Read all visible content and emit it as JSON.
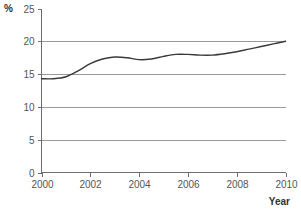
{
  "chart_data": {
    "type": "line",
    "title": "",
    "xlabel": "Year",
    "ylabel": "%",
    "xlim": [
      2000,
      2010
    ],
    "ylim": [
      0,
      25
    ],
    "grid": true,
    "legend_position": "none",
    "y_ticks": [
      0,
      5,
      10,
      15,
      20,
      25
    ],
    "y_tick_labels": [
      "0",
      "5",
      "10",
      "15",
      "20",
      "25"
    ],
    "x_ticks": [
      2000,
      2002,
      2004,
      2006,
      2008,
      2010
    ],
    "x_tick_labels": [
      "2000",
      "2002",
      "2004",
      "2006",
      "2008",
      "2010"
    ],
    "gridlines_y": [
      5,
      10,
      15,
      20
    ],
    "series": [
      {
        "name": "percentage",
        "color": "#3a3a3a",
        "x": [
          2000.0,
          2000.5,
          2001.0,
          2001.5,
          2002.0,
          2002.5,
          2003.0,
          2003.5,
          2004.0,
          2004.5,
          2005.0,
          2005.5,
          2006.0,
          2006.5,
          2007.0,
          2007.5,
          2008.0,
          2008.5,
          2009.0,
          2009.5,
          2010.0
        ],
        "values": [
          14.3,
          14.3,
          14.6,
          15.5,
          16.6,
          17.3,
          17.6,
          17.5,
          17.2,
          17.3,
          17.7,
          18.0,
          18.0,
          17.9,
          17.9,
          18.1,
          18.4,
          18.8,
          19.2,
          19.6,
          20.0
        ]
      }
    ]
  },
  "axes": {
    "y_axis_title": "%",
    "x_axis_title": "Year"
  },
  "colors": {
    "curve": "#3a3a3a",
    "grid": "#9a9a9a",
    "axis": "#6d6d6d",
    "tick_text": "#555555",
    "title_text": "#333333",
    "background": "#ffffff"
  }
}
